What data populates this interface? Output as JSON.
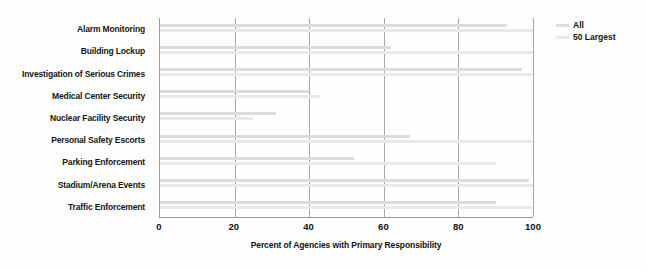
{
  "chart_data": {
    "type": "bar",
    "orientation": "horizontal",
    "title": "",
    "xlabel": "Percent of Agencies with Primary Responsibility",
    "ylabel": "",
    "xlim": [
      0,
      100
    ],
    "xticks": [
      0,
      20,
      40,
      60,
      80,
      100
    ],
    "grid": "vertical",
    "legend_position": "top-right",
    "categories": [
      "Alarm Monitoring",
      "Building Lockup",
      "Investigation of Serious Crimes",
      "Medical Center Security",
      "Nuclear Facility Security",
      "Personal Safety Escorts",
      "Parking Enforcement",
      "Stadium/Arena Events",
      "Traffic Enforcement"
    ],
    "series": [
      {
        "name": "All",
        "color": "#dcdcdc",
        "values": [
          93,
          62,
          97,
          40,
          31,
          67,
          52,
          99,
          90
        ]
      },
      {
        "name": "50 Largest",
        "color": "#e9e9e9",
        "values": [
          100,
          100,
          100,
          43,
          25,
          100,
          90,
          100,
          100
        ]
      }
    ]
  },
  "legend": {
    "items": [
      {
        "label": "All",
        "color": "#dcdcdc"
      },
      {
        "label": "50 Largest",
        "color": "#e9e9e9"
      }
    ]
  }
}
